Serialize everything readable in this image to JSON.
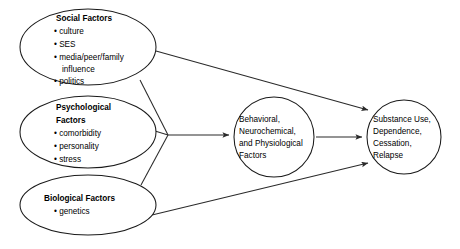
{
  "diagram": {
    "colors": {
      "stroke": "#1a1a1a",
      "connector": "#2a2a2a",
      "background": "#ffffff",
      "text": "#000000"
    },
    "nodes": {
      "social": {
        "title": "Social Factors",
        "items": [
          "culture",
          "SES",
          "media/peer/family",
          "influence",
          "politics"
        ],
        "bullets": [
          "• culture",
          "• SES",
          "• media/peer/family",
          "influence",
          "• politics"
        ]
      },
      "psychological": {
        "title_line1": "Psychological",
        "title_line2": "Factors",
        "items": [
          "comorbidity",
          "personality",
          "stress"
        ],
        "bullets": [
          "• comorbidity",
          "• personality",
          "• stress"
        ]
      },
      "biological": {
        "title": "Biological Factors",
        "items": [
          "genetics"
        ],
        "bullets": [
          "• genetics"
        ]
      },
      "mediator": {
        "lines": [
          "Behavioral,",
          "Neurochemical,",
          "and Physiological",
          "Factors"
        ]
      },
      "outcome": {
        "lines": [
          "Substance Use,",
          "Dependence,",
          "Cessation,",
          "Relapse"
        ]
      }
    },
    "edges": [
      {
        "name": "social-to-outcome",
        "from": "social",
        "to": "outcome",
        "style": "arrow"
      },
      {
        "name": "social-to-junction",
        "from": "social",
        "to": "junction",
        "style": "line"
      },
      {
        "name": "psychological-to-junction",
        "from": "psychological",
        "to": "junction",
        "style": "line"
      },
      {
        "name": "biological-to-junction",
        "from": "biological",
        "to": "junction",
        "style": "line"
      },
      {
        "name": "junction-to-mediator",
        "from": "junction",
        "to": "mediator",
        "style": "arrow"
      },
      {
        "name": "mediator-to-outcome",
        "from": "mediator",
        "to": "outcome",
        "style": "arrow"
      },
      {
        "name": "biological-to-outcome",
        "from": "biological",
        "to": "outcome",
        "style": "arrow"
      }
    ]
  }
}
